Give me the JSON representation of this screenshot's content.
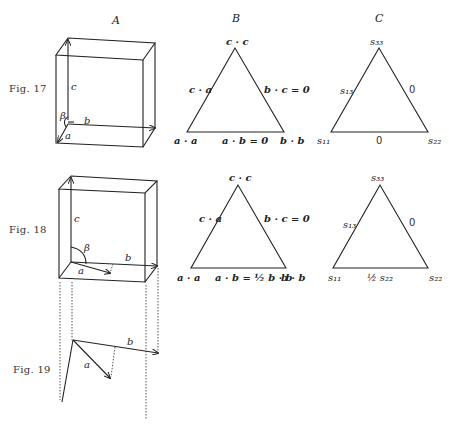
{
  "columns": {
    "a": "A",
    "b": "B",
    "c": "C"
  },
  "figures": {
    "fig17": {
      "label": "Fig. 17",
      "box_labels": {
        "c": "c",
        "b": "b",
        "a": "a",
        "beta": "β"
      },
      "triangle_b": {
        "top": "c · c",
        "left_side": "c · a",
        "right_side": "b · c = 0",
        "bottom_left": "a · a",
        "bottom": "a · b = 0",
        "bottom_right": "b · b"
      },
      "triangle_c": {
        "top": "s₃₃",
        "left_side": "s₁₃",
        "right_side": "0",
        "bottom_left": "s₁₁",
        "bottom": "0",
        "bottom_right": "s₂₂"
      }
    },
    "fig18": {
      "label": "Fig. 18",
      "box_labels": {
        "c": "c",
        "b": "b",
        "a": "a",
        "beta": "β"
      },
      "triangle_b": {
        "top": "c · c",
        "left_side": "c · a",
        "right_side": "b · c = 0",
        "bottom_left": "a · a",
        "bottom": "a · b = ½ b · b",
        "bottom_right": "b · b"
      },
      "triangle_c": {
        "top": "s₃₃",
        "left_side": "s₁₃",
        "right_side": "0",
        "bottom_left": "s₁₁",
        "bottom": "½ s₂₂",
        "bottom_right": "s₂₂"
      }
    },
    "fig19": {
      "label": "Fig. 19",
      "vector_labels": {
        "a": "a",
        "b": "b"
      }
    }
  }
}
